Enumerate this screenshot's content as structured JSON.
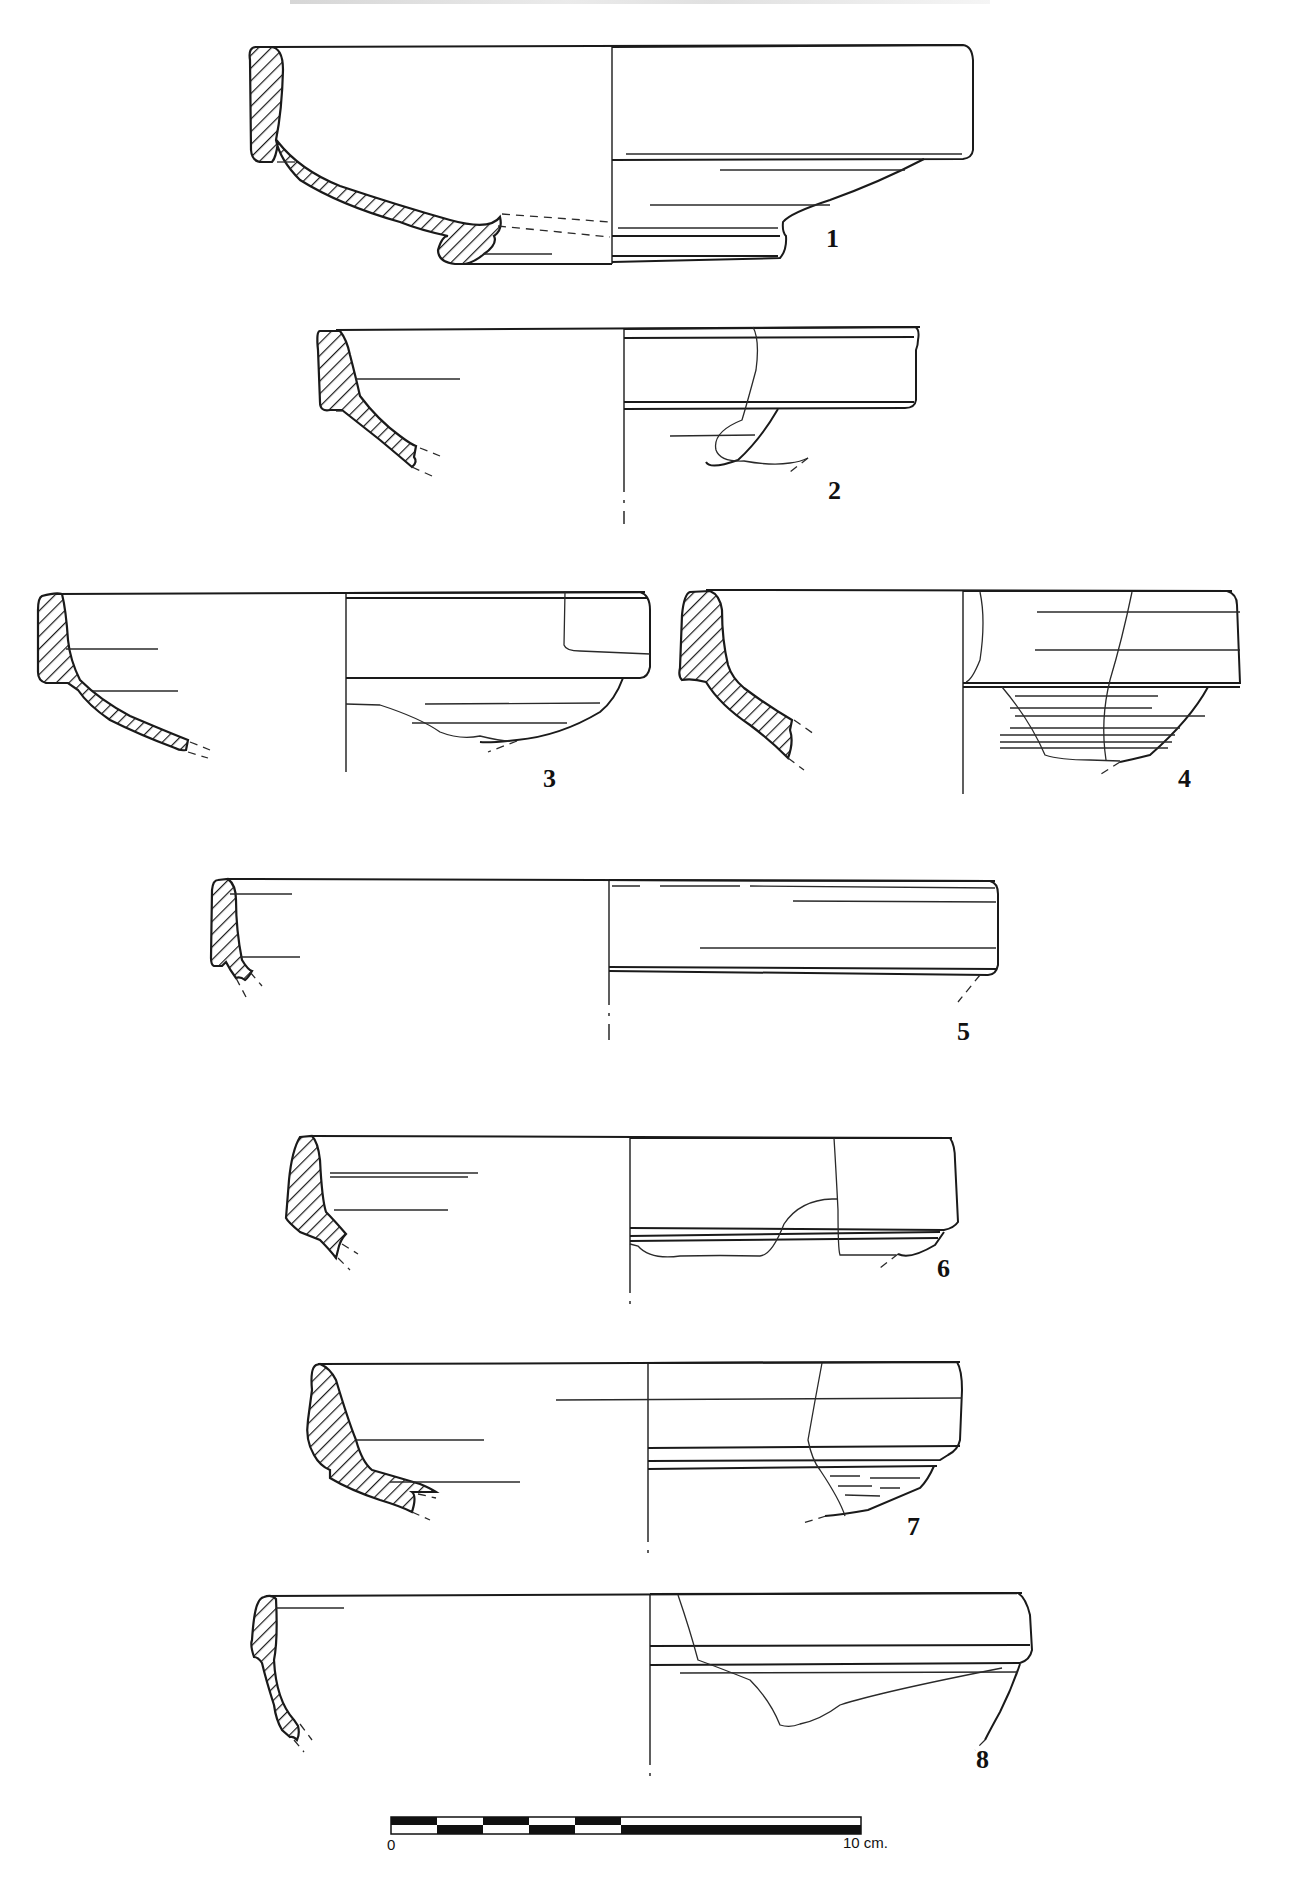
{
  "plate": {
    "title_cut": "",
    "figures": [
      {
        "id": 1,
        "label": "1",
        "x": 826,
        "y": 226
      },
      {
        "id": 2,
        "label": "2",
        "x": 828,
        "y": 478
      },
      {
        "id": 3,
        "label": "3",
        "x": 543,
        "y": 766
      },
      {
        "id": 4,
        "label": "4",
        "x": 1178,
        "y": 766
      },
      {
        "id": 5,
        "label": "5",
        "x": 957,
        "y": 1019
      },
      {
        "id": 6,
        "label": "6",
        "x": 937,
        "y": 1256
      },
      {
        "id": 7,
        "label": "7",
        "x": 907,
        "y": 1514
      },
      {
        "id": 8,
        "label": "8",
        "x": 976,
        "y": 1747
      }
    ]
  },
  "scale_bar": {
    "start_label": "0",
    "end_label": "10 cm.",
    "length_cm": 10,
    "segments_checkered": 5
  }
}
